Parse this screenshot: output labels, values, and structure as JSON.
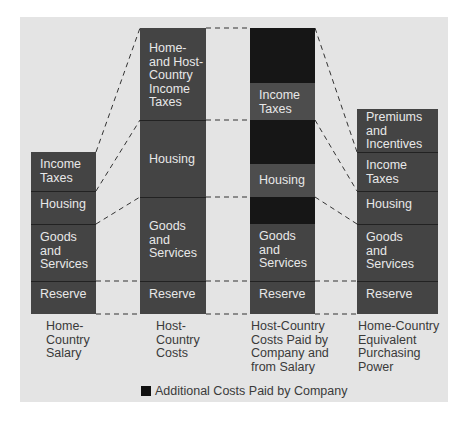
{
  "diagram": {
    "colors": {
      "panel_bg": "#e4e4e4",
      "segment": "#444444",
      "segment_in_paid_column": "#4d4d4d",
      "company_paid": "#161616",
      "label_text": "#e8e8e8",
      "caption_text": "#3a3a3a"
    },
    "columns": [
      {
        "caption": "Home-\nCountry\nSalary",
        "segments": [
          {
            "label": "Income\nTaxes",
            "type": "salary"
          },
          {
            "label": "Housing",
            "type": "salary"
          },
          {
            "label": "Goods\nand\nServices",
            "type": "salary"
          },
          {
            "label": "Reserve",
            "type": "salary"
          }
        ]
      },
      {
        "caption": "Host-\nCountry\nCosts",
        "segments": [
          {
            "label": "Home-\nand Host-\nCountry\nIncome\nTaxes",
            "type": "cost"
          },
          {
            "label": "Housing",
            "type": "cost"
          },
          {
            "label": "Goods\nand\nServices",
            "type": "cost"
          },
          {
            "label": "Reserve",
            "type": "cost"
          }
        ]
      },
      {
        "caption": "Host-Country\nCosts Paid by\nCompany and\nfrom Salary",
        "segments": [
          {
            "label": "",
            "type": "company_paid"
          },
          {
            "label": "Income\nTaxes",
            "type": "salary"
          },
          {
            "label": "",
            "type": "company_paid"
          },
          {
            "label": "Housing",
            "type": "salary"
          },
          {
            "label": "",
            "type": "company_paid"
          },
          {
            "label": "Goods\nand\nServices",
            "type": "salary"
          },
          {
            "label": "Reserve",
            "type": "salary"
          }
        ]
      },
      {
        "caption": "Home-Country\nEquivalent\nPurchasing\nPower",
        "segments": [
          {
            "label": "Premiums\nand\nIncentives",
            "type": "salary"
          },
          {
            "label": "Income\nTaxes",
            "type": "salary"
          },
          {
            "label": "Housing",
            "type": "salary"
          },
          {
            "label": "Goods\nand\nServices",
            "type": "salary"
          },
          {
            "label": "Reserve",
            "type": "salary"
          }
        ]
      }
    ],
    "legend": {
      "swatch_color": "#111111",
      "label": "Additional Costs Paid by Company"
    }
  }
}
